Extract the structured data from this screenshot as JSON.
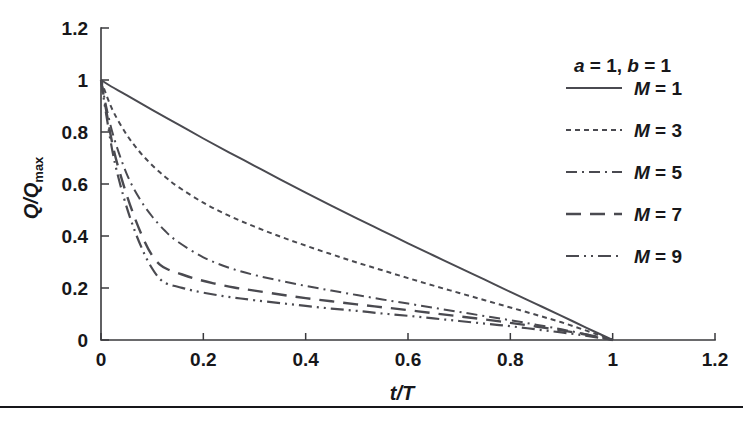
{
  "chart_data": {
    "type": "line",
    "title": "",
    "xlabel": "t/T",
    "ylabel": "Q/Qmax",
    "xlabel_parts": {
      "italic1": "t",
      "slash": "/",
      "italic2": "T"
    },
    "ylabel_parts": {
      "italic1": "Q",
      "slash": "/",
      "italic2": "Q",
      "subscript": "max"
    },
    "xlim": [
      0,
      1.2
    ],
    "ylim": [
      0,
      1.2
    ],
    "xticks": [
      0,
      0.2,
      0.4,
      0.6,
      0.8,
      1,
      1.2
    ],
    "xticklabels": [
      "0",
      "0.2",
      "0.4",
      "0.6",
      "0.8",
      "1",
      "1.2"
    ],
    "yticks": [
      0,
      0.2,
      0.4,
      0.6,
      0.8,
      1,
      1.2
    ],
    "yticklabels": [
      "0",
      "0.2",
      "0.4",
      "0.6",
      "0.8",
      "1",
      "1.2"
    ],
    "grid": false,
    "legend_position": "upper-right-outside",
    "annotation": "a = 1, b = 1",
    "annotation_parts": [
      {
        "italic": "a",
        "rest": " = 1, "
      },
      {
        "italic": "b",
        "rest": " = 1"
      }
    ],
    "line_color": "#4a4a50",
    "series": [
      {
        "name": "M = 1",
        "label_italic": "M",
        "label_rest": " = 1",
        "dash": "none",
        "dasharray": "",
        "width": 2.0,
        "x": [
          0,
          0.02,
          0.05,
          0.1,
          0.15,
          0.2,
          0.25,
          0.3,
          0.35,
          0.4,
          0.45,
          0.5,
          0.55,
          0.6,
          0.65,
          0.7,
          0.75,
          0.8,
          0.85,
          0.9,
          0.95,
          1.0
        ],
        "y": [
          1.0,
          0.975,
          0.942,
          0.885,
          0.83,
          0.775,
          0.722,
          0.67,
          0.618,
          0.567,
          0.517,
          0.468,
          0.42,
          0.372,
          0.325,
          0.278,
          0.232,
          0.185,
          0.139,
          0.093,
          0.046,
          0.0
        ]
      },
      {
        "name": "M = 3",
        "label_italic": "M",
        "label_rest": " = 3",
        "dash": "dotted-fine",
        "dasharray": "5 4",
        "width": 2.0,
        "x": [
          0,
          0.01,
          0.025,
          0.05,
          0.075,
          0.1,
          0.125,
          0.15,
          0.2,
          0.25,
          0.3,
          0.35,
          0.4,
          0.45,
          0.5,
          0.55,
          0.6,
          0.65,
          0.7,
          0.75,
          0.8,
          0.85,
          0.9,
          0.95,
          1.0
        ],
        "y": [
          1.0,
          0.945,
          0.875,
          0.79,
          0.725,
          0.672,
          0.628,
          0.59,
          0.528,
          0.478,
          0.436,
          0.398,
          0.363,
          0.33,
          0.298,
          0.268,
          0.238,
          0.209,
          0.181,
          0.153,
          0.125,
          0.097,
          0.068,
          0.035,
          0.0
        ]
      },
      {
        "name": "M = 5",
        "label_italic": "M",
        "label_rest": " = 5",
        "dash": "dash-dot",
        "dasharray": "11 5 2 5",
        "width": 2.0,
        "x": [
          0,
          0.01,
          0.025,
          0.05,
          0.075,
          0.1,
          0.125,
          0.15,
          0.2,
          0.25,
          0.3,
          0.35,
          0.4,
          0.45,
          0.5,
          0.55,
          0.6,
          0.65,
          0.7,
          0.75,
          0.8,
          0.85,
          0.9,
          0.95,
          1.0
        ],
        "y": [
          1.0,
          0.9,
          0.78,
          0.64,
          0.545,
          0.475,
          0.42,
          0.378,
          0.318,
          0.278,
          0.25,
          0.228,
          0.208,
          0.19,
          0.173,
          0.156,
          0.14,
          0.124,
          0.108,
          0.092,
          0.076,
          0.059,
          0.041,
          0.021,
          0.0
        ]
      },
      {
        "name": "M = 7",
        "label_italic": "M",
        "label_rest": " = 7",
        "dash": "long-dash",
        "dasharray": "15 9",
        "width": 2.4,
        "x": [
          0,
          0.01,
          0.025,
          0.045,
          0.065,
          0.085,
          0.1,
          0.115,
          0.13,
          0.15,
          0.18,
          0.22,
          0.26,
          0.3,
          0.35,
          0.4,
          0.45,
          0.5,
          0.55,
          0.6,
          0.65,
          0.7,
          0.75,
          0.8,
          0.85,
          0.9,
          0.95,
          1.0
        ],
        "y": [
          1.0,
          0.885,
          0.73,
          0.59,
          0.475,
          0.38,
          0.325,
          0.29,
          0.272,
          0.258,
          0.238,
          0.218,
          0.202,
          0.19,
          0.175,
          0.161,
          0.149,
          0.137,
          0.126,
          0.115,
          0.103,
          0.091,
          0.079,
          0.066,
          0.052,
          0.037,
          0.02,
          0.0
        ]
      },
      {
        "name": "M = 9",
        "label_italic": "M",
        "label_rest": " = 9",
        "dash": "dash-dot-dot",
        "dasharray": "13 5 2 5 2 5",
        "width": 2.2,
        "x": [
          0,
          0.01,
          0.025,
          0.045,
          0.065,
          0.085,
          0.1,
          0.115,
          0.13,
          0.15,
          0.18,
          0.22,
          0.26,
          0.3,
          0.35,
          0.4,
          0.45,
          0.5,
          0.55,
          0.6,
          0.65,
          0.7,
          0.75,
          0.8,
          0.85,
          0.9,
          0.95,
          1.0
        ],
        "y": [
          1.0,
          0.87,
          0.7,
          0.545,
          0.425,
          0.33,
          0.275,
          0.235,
          0.215,
          0.205,
          0.19,
          0.175,
          0.163,
          0.153,
          0.142,
          0.131,
          0.121,
          0.112,
          0.102,
          0.093,
          0.083,
          0.073,
          0.063,
          0.053,
          0.041,
          0.029,
          0.016,
          0.0
        ]
      }
    ]
  },
  "legend": {
    "header": "a = 1, b = 1",
    "entries": [
      "M = 1",
      "M = 3",
      "M = 5",
      "M = 7",
      "M = 9"
    ]
  }
}
